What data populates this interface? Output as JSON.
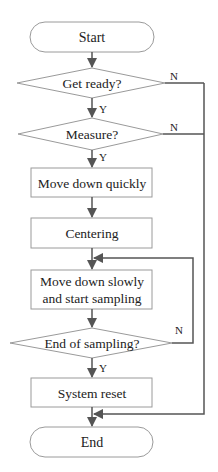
{
  "diagram": {
    "type": "flowchart",
    "nodes": {
      "start": {
        "label": "Start",
        "shape": "terminator"
      },
      "get_ready": {
        "label": "Get ready?",
        "shape": "decision"
      },
      "measure": {
        "label": "Measure?",
        "shape": "decision"
      },
      "move_quick": {
        "label": "Move down quickly",
        "shape": "process"
      },
      "centering": {
        "label": "Centering",
        "shape": "process"
      },
      "move_slow_1": {
        "label": "Move down slowly",
        "shape": "process"
      },
      "move_slow_2": {
        "label": "and start sampling",
        "shape": "process"
      },
      "end_sampling": {
        "label": "End of sampling?",
        "shape": "decision"
      },
      "reset": {
        "label": "System reset",
        "shape": "process"
      },
      "end": {
        "label": "End",
        "shape": "terminator"
      }
    },
    "edge_labels": {
      "yes": "Y",
      "no": "N"
    },
    "edges": [
      {
        "from": "start",
        "to": "get_ready"
      },
      {
        "from": "get_ready",
        "to": "measure",
        "label": "Y"
      },
      {
        "from": "get_ready",
        "to": "end",
        "label": "N"
      },
      {
        "from": "measure",
        "to": "move_quick",
        "label": "Y"
      },
      {
        "from": "measure",
        "to": "end",
        "label": "N"
      },
      {
        "from": "move_quick",
        "to": "centering"
      },
      {
        "from": "centering",
        "to": "move_slow"
      },
      {
        "from": "move_slow",
        "to": "end_sampling"
      },
      {
        "from": "end_sampling",
        "to": "reset",
        "label": "Y"
      },
      {
        "from": "end_sampling",
        "to": "move_slow",
        "label": "N"
      },
      {
        "from": "reset",
        "to": "end"
      }
    ],
    "colors": {
      "shape_stroke": "#9a9a9a",
      "line": "#555555",
      "text": "#222222"
    }
  }
}
